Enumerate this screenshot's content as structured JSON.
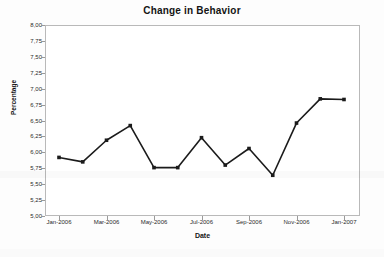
{
  "chart_data": {
    "type": "line",
    "title": "Change in Behavior",
    "xlabel": "Date",
    "ylabel": "Percentage",
    "categories": [
      "Jan-2006",
      "Feb-2006",
      "Mar-2006",
      "Apr-2006",
      "May-2006",
      "Jun-2006",
      "Jul-2006",
      "Aug-2006",
      "Sep-2006",
      "Oct-2006",
      "Nov-2006",
      "Dec-2006",
      "Jan-2007"
    ],
    "values": [
      5.92,
      5.85,
      6.19,
      6.42,
      5.76,
      5.76,
      6.23,
      5.8,
      6.06,
      5.64,
      6.46,
      6.84,
      6.83
    ],
    "ylim": [
      5.0,
      8.0
    ],
    "ytick_values": [
      5.0,
      5.25,
      5.5,
      5.75,
      6.0,
      6.25,
      6.5,
      6.75,
      7.0,
      7.25,
      7.5,
      7.75,
      8.0
    ],
    "ytick_labels": [
      "5,00",
      "5,25",
      "5,50",
      "5,75",
      "6,00",
      "6,25",
      "6,50",
      "6,75",
      "7,00",
      "7,25",
      "7,50",
      "7,75",
      "8,00"
    ],
    "xtick_labels": [
      "Jan-2006",
      "Mar-2006",
      "May-2006",
      "Jul-2006",
      "Sep-2006",
      "Nov-2006",
      "Jan-2007"
    ],
    "xtick_indices": [
      0,
      2,
      4,
      6,
      8,
      10,
      12
    ],
    "grid": false,
    "legend": "none",
    "series_color": "#1b1b1b",
    "marker": "square",
    "plot_background": "#ffffff",
    "frame_color": "#b9b9b9"
  }
}
